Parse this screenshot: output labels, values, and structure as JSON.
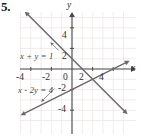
{
  "problem": {
    "number": "5."
  },
  "chart_data": {
    "type": "line",
    "title": "",
    "xlabel": "x",
    "ylabel": "y",
    "xlim": [
      -5.2,
      5.8
    ],
    "ylim": [
      -5.6,
      5.4
    ],
    "grid": true,
    "grid_step": 1,
    "legend_position": "inline-annotation",
    "x_ticks": [
      -4,
      -2,
      0,
      2,
      4
    ],
    "x_tick_labels": [
      "-4",
      "-2",
      "0",
      "2",
      "4"
    ],
    "y_ticks": [
      4,
      2,
      -2,
      -4
    ],
    "y_tick_labels": [
      "4",
      "2",
      "-2",
      "-4"
    ],
    "series": [
      {
        "name": "x + y = 1",
        "label": "x + y = 1",
        "slope": -1,
        "intercept": 1,
        "x_intercept": 1,
        "y_intercept": 1,
        "points": [
          [
            -4.6,
            5.6
          ],
          [
            5.4,
            -4.4
          ]
        ],
        "arrow_both_ends": true,
        "color": "#6b6b6b"
      },
      {
        "name": "x - 2y = 4",
        "label": "x - 2y = 4",
        "slope": 0.5,
        "intercept": -2,
        "x_intercept": 4,
        "y_intercept": -2,
        "points": [
          [
            -5.0,
            -4.5
          ],
          [
            5.6,
            0.8
          ]
        ],
        "arrow_both_ends": true,
        "color": "#6b6b6b"
      }
    ],
    "intersection": [
      2,
      -1
    ],
    "annotations": [
      {
        "text": "x + y = 1",
        "at": [
          -4.6,
          1.7
        ],
        "leader_to": [
          -2.1,
          2.6
        ]
      },
      {
        "text": "x - 2y = 4",
        "at": [
          -5.0,
          -2.0
        ],
        "leader_to": [
          -3.0,
          -3.2
        ]
      }
    ]
  },
  "axes": {
    "x_axis_label": "x",
    "y_axis_label": "y"
  },
  "colors": {
    "grid": "#ece3e3",
    "grid_major": "#e2d8d8",
    "axis": "#4a4a4a",
    "line": "#6b6b6b",
    "text": "#2e2e2e",
    "background": "#ffffff"
  }
}
